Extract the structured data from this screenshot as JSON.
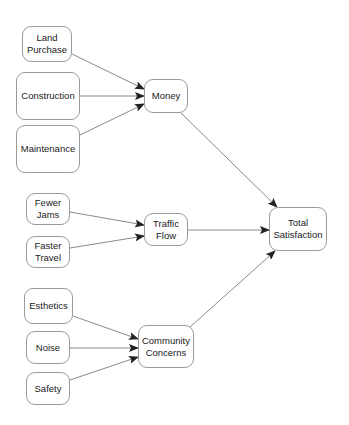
{
  "diagram": {
    "type": "influence-diagram",
    "colors": {
      "edge": "#8a8a8a",
      "arrowhead": "#222222",
      "node_border": "#9a9a9a",
      "text": "#1a1a1a"
    },
    "nodes": [
      {
        "id": "land_purchase",
        "label": "Land\nPurchase",
        "x": 22,
        "y": 26,
        "w": 50,
        "h": 36
      },
      {
        "id": "construction",
        "label": "Construction",
        "x": 16,
        "y": 72,
        "w": 64,
        "h": 48
      },
      {
        "id": "maintenance",
        "label": "Maintenance",
        "x": 16,
        "y": 125,
        "w": 64,
        "h": 48
      },
      {
        "id": "money",
        "label": "Money",
        "x": 144,
        "y": 79,
        "w": 44,
        "h": 34
      },
      {
        "id": "fewer_jams",
        "label": "Fewer\nJams",
        "x": 26,
        "y": 193,
        "w": 44,
        "h": 32
      },
      {
        "id": "faster_travel",
        "label": "Faster\nTravel",
        "x": 26,
        "y": 236,
        "w": 44,
        "h": 32
      },
      {
        "id": "traffic_flow",
        "label": "Traffic\nFlow",
        "x": 144,
        "y": 213,
        "w": 44,
        "h": 33
      },
      {
        "id": "esthetics",
        "label": "Esthetics",
        "x": 24,
        "y": 288,
        "w": 49,
        "h": 36
      },
      {
        "id": "noise",
        "label": "Noise",
        "x": 26,
        "y": 331,
        "w": 44,
        "h": 33
      },
      {
        "id": "safety",
        "label": "Safety",
        "x": 26,
        "y": 372,
        "w": 44,
        "h": 33
      },
      {
        "id": "community_concerns",
        "label": "Community\nConcerns",
        "x": 138,
        "y": 325,
        "w": 56,
        "h": 43
      },
      {
        "id": "total_satisfaction",
        "label": "Total\nSatisfaction",
        "x": 269,
        "y": 207,
        "w": 58,
        "h": 44
      }
    ],
    "edges": [
      {
        "from": "land_purchase",
        "to": "money",
        "x1": 72,
        "y1": 54,
        "x2": 144,
        "y2": 89
      },
      {
        "from": "construction",
        "to": "money",
        "x1": 80,
        "y1": 96,
        "x2": 144,
        "y2": 96
      },
      {
        "from": "maintenance",
        "to": "money",
        "x1": 80,
        "y1": 135,
        "x2": 144,
        "y2": 104
      },
      {
        "from": "money",
        "to": "total_satisfaction",
        "x1": 181,
        "y1": 113,
        "x2": 277,
        "y2": 207
      },
      {
        "from": "fewer_jams",
        "to": "traffic_flow",
        "x1": 70,
        "y1": 212,
        "x2": 144,
        "y2": 225
      },
      {
        "from": "faster_travel",
        "to": "traffic_flow",
        "x1": 70,
        "y1": 248,
        "x2": 144,
        "y2": 236
      },
      {
        "from": "traffic_flow",
        "to": "total_satisfaction",
        "x1": 188,
        "y1": 230,
        "x2": 269,
        "y2": 230
      },
      {
        "from": "esthetics",
        "to": "community_concerns",
        "x1": 73,
        "y1": 316,
        "x2": 138,
        "y2": 339
      },
      {
        "from": "noise",
        "to": "community_concerns",
        "x1": 70,
        "y1": 348,
        "x2": 138,
        "y2": 348
      },
      {
        "from": "safety",
        "to": "community_concerns",
        "x1": 70,
        "y1": 380,
        "x2": 138,
        "y2": 357
      },
      {
        "from": "community_concerns",
        "to": "total_satisfaction",
        "x1": 190,
        "y1": 327,
        "x2": 275,
        "y2": 251
      }
    ]
  }
}
